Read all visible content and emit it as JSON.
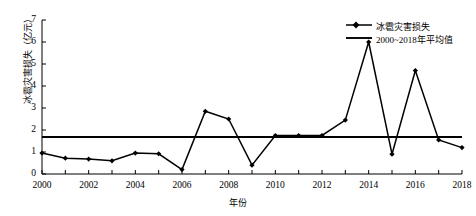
{
  "chart_data": {
    "type": "line",
    "title": "",
    "xlabel": "年份",
    "ylabel": "冰雹灾害损失（亿元）",
    "xlim": [
      2000,
      2018
    ],
    "ylim": [
      0,
      7
    ],
    "yticks": [
      0,
      1,
      2,
      3,
      4,
      5,
      6,
      7
    ],
    "xticks": [
      2000,
      2002,
      2004,
      2006,
      2008,
      2010,
      2012,
      2014,
      2016,
      2018
    ],
    "grid": false,
    "legend_position": "top-right",
    "x": [
      2000,
      2001,
      2002,
      2003,
      2004,
      2005,
      2006,
      2007,
      2008,
      2009,
      2010,
      2011,
      2012,
      2013,
      2014,
      2015,
      2016,
      2017,
      2018
    ],
    "series": [
      {
        "name": "冰雹灾害损失",
        "marker": "diamond",
        "color": "#000000",
        "values": [
          0.95,
          0.72,
          0.68,
          0.6,
          0.95,
          0.92,
          0.2,
          2.85,
          2.5,
          0.4,
          1.75,
          1.75,
          1.75,
          2.45,
          6.0,
          0.9,
          4.7,
          1.55,
          1.2
        ]
      },
      {
        "name": "2000~2018年平均值",
        "marker": "none",
        "color": "#000000",
        "constant": 1.68
      }
    ],
    "legend": [
      "冰雹灾害损失",
      "2000~2018年平均值"
    ]
  }
}
